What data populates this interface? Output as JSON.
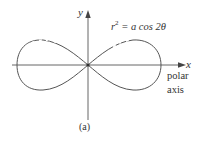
{
  "figure": {
    "equation": {
      "lhs_var": "r",
      "lhs_exp": "2",
      "rhs": " = a cos 2θ"
    },
    "axes": {
      "x_label": "x",
      "y_label": "y",
      "polar_axis_line1": "polar",
      "polar_axis_line2": "axis"
    },
    "caption": "(a)",
    "curve": {
      "name": "lemniscate",
      "formula": "r^2 = a cos 2θ",
      "color": "#555555"
    },
    "axis_color": "#555555"
  }
}
